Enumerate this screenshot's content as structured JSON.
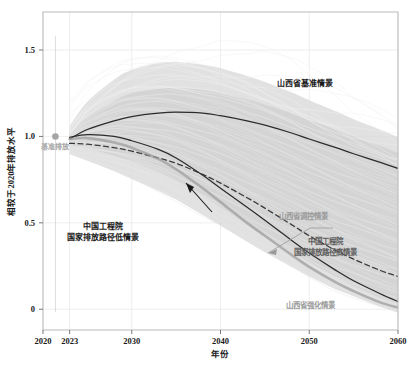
{
  "chart_data": {
    "type": "line",
    "title": "",
    "xlabel": "年份",
    "ylabel": "相较于2020年排放水平",
    "xlim": [
      2020,
      2060
    ],
    "ylim": [
      -0.12,
      1.72
    ],
    "xticks": [
      2020,
      2023,
      2030,
      2040,
      2050,
      2060
    ],
    "xticklabels": [
      "2020",
      "2023",
      "2030",
      "2040",
      "2050",
      "2060"
    ],
    "yticks": [
      0,
      0.5,
      1.0,
      1.5
    ],
    "yticklabels": [
      "0",
      "0.5",
      "1.0",
      "1.5"
    ],
    "grid": true,
    "legend_position": "inline-annotations",
    "x": [
      2023,
      2025,
      2028,
      2030,
      2033,
      2035,
      2038,
      2040,
      2043,
      2045,
      2048,
      2050,
      2053,
      2055,
      2058,
      2060
    ],
    "series": [
      {
        "name": "山西省基准情景",
        "style": "solid",
        "color": "#2b2b2b",
        "values": [
          0.985,
          1.04,
          1.09,
          1.115,
          1.135,
          1.14,
          1.135,
          1.12,
          1.09,
          1.065,
          1.02,
          0.985,
          0.935,
          0.9,
          0.85,
          0.815
        ]
      },
      {
        "name": "山西省调控情景",
        "style": "solid",
        "color": "#2b2b2b",
        "values": [
          0.995,
          1.01,
          1.0,
          0.975,
          0.925,
          0.875,
          0.775,
          0.7,
          0.59,
          0.515,
          0.4,
          0.325,
          0.225,
          0.165,
          0.09,
          0.045
        ]
      },
      {
        "name": "中国工程院 国家排放路径高情景",
        "style": "dashed",
        "color": "#3a3a3a",
        "values": [
          0.96,
          0.955,
          0.935,
          0.915,
          0.875,
          0.845,
          0.78,
          0.73,
          0.645,
          0.585,
          0.49,
          0.425,
          0.34,
          0.29,
          0.225,
          0.19
        ]
      },
      {
        "name": "山西省强化情景",
        "style": "solid-light",
        "color": "#9d9d9d",
        "values": [
          0.985,
          0.99,
          0.965,
          0.935,
          0.87,
          0.81,
          0.7,
          0.62,
          0.5,
          0.425,
          0.315,
          0.245,
          0.155,
          0.105,
          0.04,
          0.01
        ]
      }
    ],
    "bands": [
      {
        "name": "outer-uncertainty-band",
        "opacity": "light",
        "upper": [
          1.06,
          1.2,
          1.33,
          1.385,
          1.425,
          1.43,
          1.415,
          1.395,
          1.35,
          1.315,
          1.255,
          1.21,
          1.145,
          1.1,
          1.04,
          0.995
        ],
        "lower": [
          0.9,
          0.86,
          0.8,
          0.755,
          0.685,
          0.635,
          0.545,
          0.485,
          0.39,
          0.33,
          0.245,
          0.19,
          0.115,
          0.075,
          0.015,
          -0.02
        ]
      },
      {
        "name": "inner-uncertainty-band",
        "opacity": "dark",
        "upper": [
          1.02,
          1.11,
          1.205,
          1.25,
          1.275,
          1.28,
          1.27,
          1.25,
          1.215,
          1.185,
          1.135,
          1.095,
          1.04,
          1.0,
          0.945,
          0.905
        ],
        "lower": [
          0.945,
          0.93,
          0.89,
          0.855,
          0.795,
          0.745,
          0.655,
          0.59,
          0.49,
          0.425,
          0.33,
          0.27,
          0.185,
          0.135,
          0.065,
          0.03
        ]
      }
    ],
    "baseline_marker": {
      "label": "基准排放",
      "x": 2021.4,
      "y": 1.0,
      "color": "#a5a5a5"
    },
    "annotations": [
      {
        "id": "ann-baseline-scenario",
        "text": "山西省基准情景",
        "x": 305,
        "y": 86,
        "style": "dark"
      },
      {
        "id": "ann-cae-low",
        "line1": "中国工程院",
        "line2": "国家排放路径低情景",
        "x": 103,
        "y": 229,
        "style": "dark"
      },
      {
        "id": "ann-control-scenario",
        "text": "山西省调控情景",
        "x": 279,
        "y": 219,
        "style": "light"
      },
      {
        "id": "ann-cae-high",
        "line1": "中国工程院",
        "line2": "国家排放路径高情景",
        "x": 300,
        "y": 244,
        "style": "mid"
      },
      {
        "id": "ann-enhanced-scenario",
        "text": "山西省强化情景",
        "x": 286,
        "y": 308,
        "style": "light"
      }
    ],
    "colors": {
      "band_light": "#d9d9d9",
      "band_dark": "#b3b3b3",
      "spaghetti": "#ededed",
      "line_dark": "#2b2b2b",
      "line_light": "#9d9d9d",
      "frame": "#b9b9b9",
      "grid": "#e6e6e6",
      "background": "#ffffff"
    }
  }
}
